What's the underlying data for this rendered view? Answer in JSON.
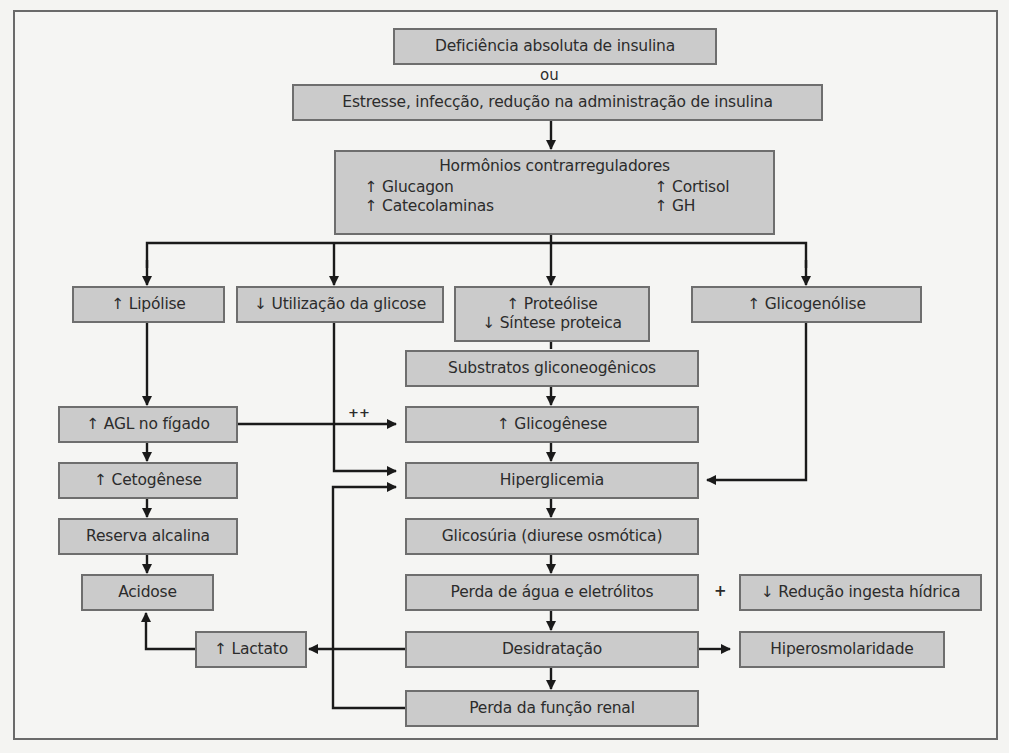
{
  "diagram": {
    "type": "flowchart",
    "language": "pt-BR",
    "colors": {
      "box_fill": "#cbcbcb",
      "box_border": "#6e6e6e",
      "background": "#f5f5f3",
      "line": "#1a1a1a"
    },
    "top": {
      "cause1": "Deficiência absoluta de insulina",
      "or_label": "ou",
      "cause2": "Estresse, infecção, redução na administração de insulina"
    },
    "hormones": {
      "title": "Hormônios contrarreguladores",
      "items": [
        {
          "label": "↑ Glucagon"
        },
        {
          "label": "↑ Cortisol"
        },
        {
          "label": "↑ Catecolaminas"
        },
        {
          "label": "↑ GH"
        }
      ]
    },
    "branches": {
      "lipolise": "↑ Lipólise",
      "utilizacao": "↓ Utilização da glicose",
      "proteolise_line1": "↑ Proteólise",
      "proteolise_line2": "↓ Síntese proteica",
      "glicogenolise": "↑ Glicogenólise"
    },
    "left_chain": {
      "agl": "↑ AGL no fígado",
      "cetogenese": "↑ Cetogênese",
      "reserva": "Reserva alcalina",
      "acidose": "Acidose",
      "lactato": "↑ Lactato"
    },
    "center_chain": {
      "substratos": "Substratos gliconeogênicos",
      "glicogenese": "↑ Glicogênese",
      "hiperglicemia": "Hiperglicemia",
      "glicosuria": "Glicosúria (diurese osmótica)",
      "perda_agua": "Perda de água e eletrólitos",
      "desidratacao": "Desidratação",
      "perda_renal": "Perda da função renal"
    },
    "right_chain": {
      "plus_label": "+",
      "reducao_ingesta": "↓ Redução ingesta hídrica",
      "hiperosmolaridade": "Hiperosmolaridade"
    },
    "edge_labels": {
      "agl_to_glicogenese": "++"
    }
  }
}
